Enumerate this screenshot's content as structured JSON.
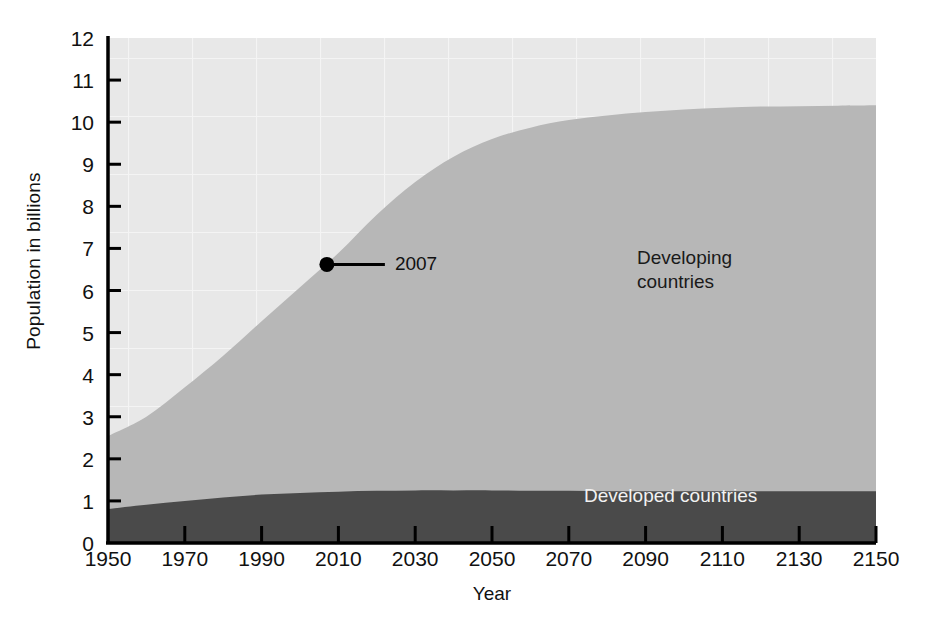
{
  "chart_data": {
    "type": "area",
    "stacked": true,
    "title": "",
    "xlabel": "Year",
    "ylabel": "Population in billions",
    "xlim": [
      1950,
      2150
    ],
    "ylim": [
      0,
      12
    ],
    "grid": true,
    "legend_position": "inline-labels",
    "x": [
      1950,
      1960,
      1970,
      1980,
      1990,
      2000,
      2010,
      2020,
      2030,
      2040,
      2050,
      2060,
      2070,
      2080,
      2090,
      2100,
      2110,
      2120,
      2130,
      2140,
      2150
    ],
    "xticks": [
      1950,
      1970,
      1990,
      2010,
      2030,
      2050,
      2070,
      2090,
      2110,
      2130,
      2150
    ],
    "xticklabels": [
      "1950",
      "1970",
      "1990",
      "2010",
      "2030",
      "2050",
      "2070",
      "2090",
      "2110",
      "2130",
      "2150"
    ],
    "yticks": [
      0,
      1,
      2,
      3,
      4,
      5,
      6,
      7,
      8,
      9,
      10,
      11,
      12
    ],
    "yticklabels": [
      "0",
      "1",
      "2",
      "3",
      "4",
      "5",
      "6",
      "7",
      "8",
      "9",
      "10",
      "11",
      "12"
    ],
    "series": [
      {
        "name": "Developed countries",
        "color": "#4a4a4a",
        "label_color": "#f2f2f2",
        "values": [
          0.81,
          0.91,
          1.0,
          1.08,
          1.15,
          1.19,
          1.22,
          1.24,
          1.25,
          1.25,
          1.25,
          1.24,
          1.24,
          1.23,
          1.23,
          1.23,
          1.23,
          1.23,
          1.23,
          1.23,
          1.23
        ]
      },
      {
        "name": "Developing countries",
        "color": "#b7b7b7",
        "label_color": "#1a1a1a",
        "values": [
          1.73,
          2.09,
          2.7,
          3.37,
          4.12,
          4.89,
          5.67,
          6.56,
          7.33,
          7.93,
          8.35,
          8.63,
          8.81,
          8.93,
          9.01,
          9.07,
          9.11,
          9.14,
          9.15,
          9.16,
          9.17
        ]
      }
    ],
    "totals": [
      2.54,
      3.0,
      3.7,
      4.45,
      5.27,
      6.08,
      6.89,
      7.8,
      8.58,
      9.18,
      9.6,
      9.87,
      10.05,
      10.16,
      10.24,
      10.3,
      10.34,
      10.37,
      10.38,
      10.39,
      10.4
    ],
    "annotations": [
      {
        "text": "2007",
        "x": 2007,
        "y": 6.62,
        "marker": "dot",
        "leader_line": true
      }
    ],
    "background_color": "#e8e8e8",
    "axis_color": "#000000"
  }
}
